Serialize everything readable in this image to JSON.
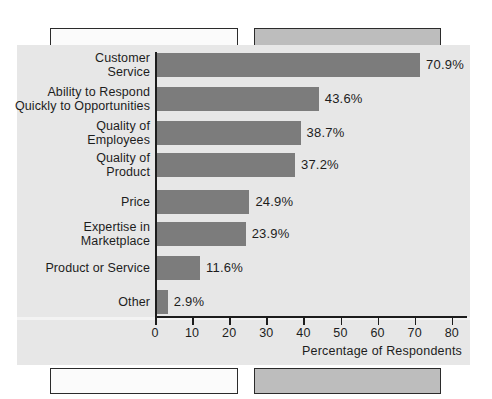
{
  "chart_data": {
    "type": "bar",
    "orientation": "horizontal",
    "title": "",
    "xlabel": "Percentage of Respondents",
    "ylabel": "",
    "xlim": [
      0,
      80
    ],
    "grid": false,
    "legend": null,
    "categories": [
      "Customer\nService",
      "Ability to Respond\nQuickly to Opportunities",
      "Quality of\nEmployees",
      "Quality of\nProduct",
      "Price",
      "Expertise in\nMarketplace",
      "Product or Service",
      "Other"
    ],
    "values": [
      70.9,
      43.6,
      38.7,
      37.2,
      24.9,
      23.9,
      11.6,
      2.9
    ],
    "value_labels": [
      "70.9%",
      "43.6%",
      "38.7%",
      "37.2%",
      "24.9%",
      "23.9%",
      "11.6%",
      "2.9%"
    ],
    "x_ticks": [
      0,
      10,
      20,
      30,
      40,
      50,
      60,
      70,
      80
    ],
    "x_tick_labels": [
      "0",
      "10",
      "20",
      "30",
      "40",
      "50",
      "60",
      "70",
      "80"
    ],
    "bar_color": "#7c7c7c",
    "axis_color": "#1d1d1d",
    "panel_background": "#e7e7e7",
    "page_background": "#ffffff"
  },
  "decor": {
    "box_light_color": "#fbfbfb",
    "box_dark_color": "#bdbdbd",
    "box_border_color": "#2b2b2b"
  }
}
